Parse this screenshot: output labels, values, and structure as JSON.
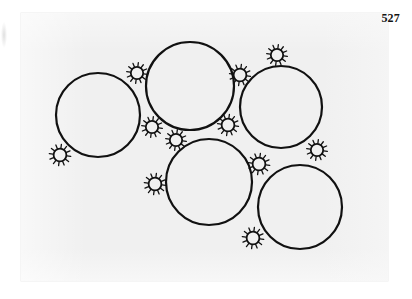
{
  "page": {
    "folio_number": "527",
    "background_color": "#ffffff",
    "plate_color": "#f0f0f0",
    "ink_color": "#111111"
  },
  "figure": {
    "title": "",
    "caption": "",
    "kind": "circle-packing-line-drawing",
    "plate": {
      "x": 21,
      "y": 13,
      "width": 367,
      "height": 268
    },
    "stroke_color": "#111111",
    "big_circle_stroke_width": 2.2,
    "small_sun_stroke_width": 1.3,
    "large_circles": [
      {
        "name": "circle-left",
        "cx": 98,
        "cy": 115,
        "r": 42
      },
      {
        "name": "circle-top-middle",
        "cx": 190,
        "cy": 86,
        "r": 44
      },
      {
        "name": "circle-top-right",
        "cx": 281,
        "cy": 107,
        "r": 41
      },
      {
        "name": "circle-bottom-middle",
        "cx": 209,
        "cy": 182,
        "r": 43
      },
      {
        "name": "circle-bottom-right",
        "cx": 300,
        "cy": 207,
        "r": 42
      }
    ],
    "small_suns": [
      {
        "name": "sun-upper-left-gap",
        "cx": 137,
        "cy": 73,
        "r": 6.2,
        "spikes": 12,
        "spike_len": 4.2
      },
      {
        "name": "sun-top-right-crest",
        "cx": 277,
        "cy": 55,
        "r": 6.2,
        "spikes": 12,
        "spike_len": 4.2
      },
      {
        "name": "sun-upper-right-gap",
        "cx": 240,
        "cy": 75,
        "r": 6.4,
        "spikes": 12,
        "spike_len": 4.2
      },
      {
        "name": "sun-left-outer",
        "cx": 60,
        "cy": 155,
        "r": 6.4,
        "spikes": 12,
        "spike_len": 4.4
      },
      {
        "name": "sun-center-left-gap",
        "cx": 152,
        "cy": 127,
        "r": 6.2,
        "spikes": 12,
        "spike_len": 4.2
      },
      {
        "name": "sun-center-gap",
        "cx": 176,
        "cy": 140,
        "r": 6.2,
        "spikes": 12,
        "spike_len": 4.2
      },
      {
        "name": "sun-center-right-gap",
        "cx": 228,
        "cy": 125,
        "r": 6.4,
        "spikes": 12,
        "spike_len": 4.2
      },
      {
        "name": "sun-lower-left-outer",
        "cx": 155,
        "cy": 184,
        "r": 6.4,
        "spikes": 12,
        "spike_len": 4.4
      },
      {
        "name": "sun-lower-center-gap",
        "cx": 259,
        "cy": 164,
        "r": 6.4,
        "spikes": 12,
        "spike_len": 4.4
      },
      {
        "name": "sun-right-outer",
        "cx": 317,
        "cy": 150,
        "r": 6.2,
        "spikes": 12,
        "spike_len": 4.2
      },
      {
        "name": "sun-bottom-outer",
        "cx": 253,
        "cy": 238,
        "r": 6.4,
        "spikes": 12,
        "spike_len": 4.4
      }
    ]
  }
}
